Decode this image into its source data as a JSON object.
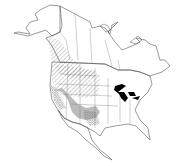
{
  "map": {
    "region": "North America",
    "type": "species range map",
    "legend": [
      {
        "pattern": "diagonal-hatch",
        "meaning": "range area (hatched)"
      },
      {
        "pattern": "crosshatch",
        "meaning": "range area (crosshatched)"
      },
      {
        "pattern": "gray-fill",
        "meaning": "range area (solid gray)"
      }
    ],
    "colors": {
      "background": "#ffffff",
      "borders": "#555555",
      "lakes": "#000000",
      "gray_fill": "#bbbbbb",
      "hatch": "#666666"
    }
  }
}
